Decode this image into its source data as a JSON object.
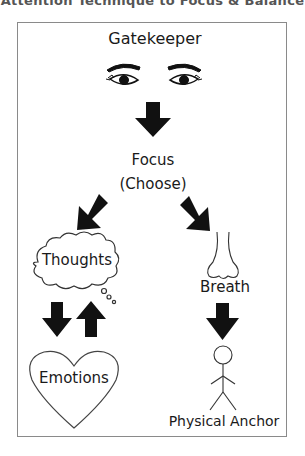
{
  "header": {
    "title": "Attention Technique to Focus & Balance"
  },
  "diagram": {
    "gatekeeper": {
      "label": "Gatekeeper",
      "icon": "eyes-icon"
    },
    "focus": {
      "label": "Focus",
      "sublabel": "(Choose)"
    },
    "thoughts": {
      "label": "Thoughts",
      "icon": "thought-cloud-icon"
    },
    "emotions": {
      "label": "Emotions",
      "icon": "heart-icon"
    },
    "breath": {
      "label": "Breath",
      "icon": "nose-icon"
    },
    "physical_anchor": {
      "label": "Physical Anchor",
      "icon": "stick-figure-icon"
    },
    "arrows": [
      {
        "from": "gatekeeper",
        "to": "focus",
        "direction": "down"
      },
      {
        "from": "focus",
        "to": "thoughts",
        "direction": "down-left"
      },
      {
        "from": "focus",
        "to": "breath",
        "direction": "down-right"
      },
      {
        "from": "thoughts",
        "to": "emotions",
        "direction": "down"
      },
      {
        "from": "emotions",
        "to": "thoughts",
        "direction": "up"
      },
      {
        "from": "breath",
        "to": "physical_anchor",
        "direction": "down"
      }
    ],
    "colors": {
      "arrow": "#111111",
      "outline": "#444444",
      "frame": "#8a8a8a"
    }
  }
}
